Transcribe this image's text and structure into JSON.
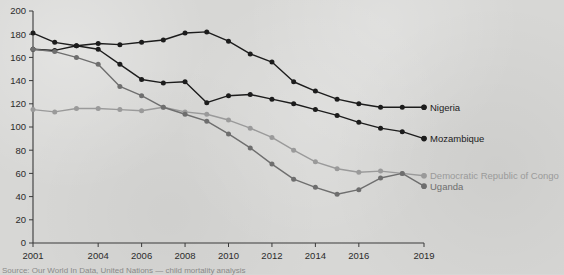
{
  "chart_data": {
    "type": "line",
    "title": "",
    "xlabel": "",
    "ylabel": "",
    "xlim": [
      2001,
      2019
    ],
    "ylim": [
      0,
      200
    ],
    "grid": false,
    "legend_position": "right-inline",
    "x": [
      2001,
      2002,
      2003,
      2004,
      2005,
      2006,
      2007,
      2008,
      2009,
      2010,
      2011,
      2012,
      2013,
      2014,
      2015,
      2016,
      2017,
      2018,
      2019
    ],
    "xtick_labels": [
      "2001",
      "2004",
      "2006",
      "2008",
      "2010",
      "2012",
      "2014",
      "2016",
      "2019"
    ],
    "xtick_values": [
      2001,
      2004,
      2006,
      2008,
      2010,
      2012,
      2014,
      2016,
      2019
    ],
    "ytick_labels": [
      "0",
      "20",
      "40",
      "60",
      "80",
      "100",
      "120",
      "140",
      "160",
      "180",
      "200"
    ],
    "ytick_values": [
      0,
      20,
      40,
      60,
      80,
      100,
      120,
      140,
      160,
      180,
      200
    ],
    "series": [
      {
        "name": "Nigeria",
        "color": "#1c1c1c",
        "values": [
          181,
          173,
          170,
          172,
          171,
          173,
          175,
          181,
          182,
          174,
          163,
          156,
          139,
          131,
          124,
          120,
          117,
          117,
          117
        ]
      },
      {
        "name": "Mozambique",
        "color": "#1c1c1c",
        "values": [
          167,
          166,
          170,
          167,
          154,
          141,
          138,
          139,
          121,
          127,
          128,
          124,
          120,
          115,
          110,
          104,
          99,
          96,
          90
        ]
      },
      {
        "name": "Democratic Republic of Congo",
        "color": "#9a9a9a",
        "values": [
          115,
          113,
          116,
          116,
          115,
          114,
          117,
          113,
          111,
          106,
          99,
          91,
          80,
          70,
          64,
          61,
          62,
          60,
          58
        ]
      },
      {
        "name": "Uganda",
        "color": "#6e6e6e",
        "values": [
          167,
          165,
          160,
          154,
          135,
          127,
          117,
          111,
          105,
          94,
          82,
          68,
          55,
          48,
          42,
          46,
          56,
          60,
          49
        ]
      }
    ]
  },
  "legend": [
    {
      "label": "Nigeria",
      "color": "#1c1c1c"
    },
    {
      "label": "Mozambique",
      "color": "#1c1c1c"
    },
    {
      "label": "Democratic Republic of Congo",
      "color": "#9a9a9a"
    },
    {
      "label": "Uganda",
      "color": "#6e6e6e"
    }
  ],
  "axis": {
    "y_max_label": "200",
    "y_min_label": "0"
  },
  "source": {
    "text": "Source: Our World In Data, United Nations — child mortality analysis"
  }
}
